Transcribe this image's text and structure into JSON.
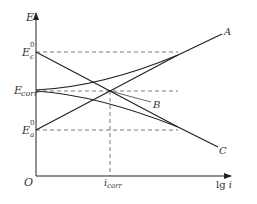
{
  "diagram": {
    "type": "Evans polarization diagram",
    "axes": {
      "y_label": "E",
      "x_label": "lg i",
      "origin_label": "O"
    },
    "y_ticks": [
      {
        "base": "E",
        "sub": "c",
        "sup": "0"
      },
      {
        "base": "E",
        "sub": "corr",
        "sup": ""
      },
      {
        "base": "E",
        "sub": "a",
        "sup": "0"
      }
    ],
    "x_ticks": [
      {
        "base": "i",
        "sub": "corr"
      }
    ],
    "curve_labels": {
      "A": "A",
      "B": "B",
      "C": "C"
    },
    "colors": {
      "line": "#222222",
      "dashed": "#555555",
      "text": "#333333"
    }
  }
}
